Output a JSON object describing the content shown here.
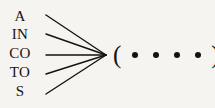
{
  "figure": {
    "type": "fan-in-diagram",
    "background_color": "#f5f4f1",
    "ink_color": "#15120f",
    "labels": [
      {
        "text": "A"
      },
      {
        "text": "IN"
      },
      {
        "text": "CO"
      },
      {
        "text": "TO"
      },
      {
        "text": "S"
      }
    ],
    "connector": {
      "kind": "converging-lines",
      "count": 5,
      "converge_point": {
        "x": 106,
        "y": 55
      },
      "starts": [
        {
          "x": 46,
          "y": 15
        },
        {
          "x": 46,
          "y": 34
        },
        {
          "x": 46,
          "y": 55
        },
        {
          "x": 46,
          "y": 74
        },
        {
          "x": 46,
          "y": 94
        }
      ],
      "stroke_width": 1.4
    },
    "group": {
      "open_paren": "(",
      "close_paren": ")",
      "dot_count": 4,
      "dot_glyph": "•"
    }
  }
}
